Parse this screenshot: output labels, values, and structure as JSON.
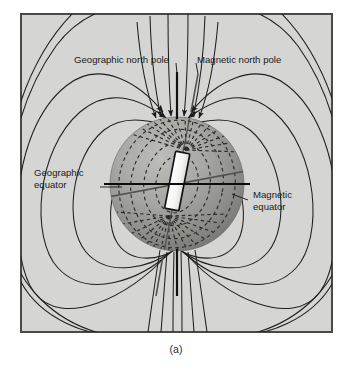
{
  "figure": {
    "caption": "(a)",
    "background_color": "#d5d5d3",
    "frame_color": "#4a4a4a",
    "page_color": "#ffffff"
  },
  "labels": {
    "geographic_north_pole": "Geographic north pole",
    "magnetic_north_pole": "Magnetic north pole",
    "geographic_equator_line1": "Geographic",
    "geographic_equator_line2": "equator",
    "magnetic_equator_line1": "Magnetic",
    "magnetic_equator_line2": "equator"
  },
  "diagram": {
    "sphere": {
      "center_x": 177,
      "center_y": 184,
      "radius": 67,
      "light_color": "#b0b0ac",
      "mid_color": "#8e8e8a",
      "dark_color": "#6d6d6a"
    },
    "bar_magnet": {
      "label": "bar magnet",
      "fill_color": "#f2f2f0",
      "stroke_color": "#1a1a1a",
      "tilt_degrees": 11
    },
    "axes": {
      "geographic_axis_color": "#141414",
      "magnetic_axis_color": "#4a4a4a",
      "geographic_equator_color": "#0d0d0d",
      "magnetic_equator_color": "#555552"
    },
    "field_lines": {
      "color": "#1f1f1f",
      "internal_dash_color": "#2a2a2a",
      "arrow_direction": "inward-to-north-pole"
    }
  }
}
